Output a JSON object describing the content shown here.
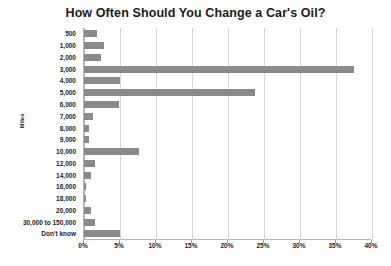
{
  "chart_data": {
    "type": "bar",
    "orientation": "horizontal",
    "title": "How Often Should You Change a Car's Oil?",
    "xlabel": "",
    "ylabel": "Miles",
    "xlim": [
      0,
      40
    ],
    "xtick_labels": [
      "0%",
      "5%",
      "10%",
      "15%",
      "20%",
      "25%",
      "30%",
      "35%",
      "40%"
    ],
    "xtick_values": [
      0,
      5,
      10,
      15,
      20,
      25,
      30,
      35,
      40
    ],
    "grid": true,
    "legend": false,
    "bar_color": "#8a8a8a",
    "gridline_color": "#d4d4d4",
    "axis_color": "#b5b5b5",
    "categories": [
      "500",
      "1,000",
      "2,000",
      "3,000",
      "4,000",
      "5,000",
      "6,000",
      "7,000",
      "8,000",
      "9,000",
      "10,000",
      "12,000",
      "14,000",
      "16,000",
      "18,000",
      "20,000",
      "30,000 to 150,000",
      "Don't know"
    ],
    "values": [
      1.8,
      2.8,
      2.4,
      37.5,
      5.0,
      23.8,
      4.8,
      1.2,
      0.7,
      0.7,
      7.6,
      1.5,
      1.0,
      0.3,
      0.3,
      1.0,
      1.5,
      5.0
    ]
  }
}
